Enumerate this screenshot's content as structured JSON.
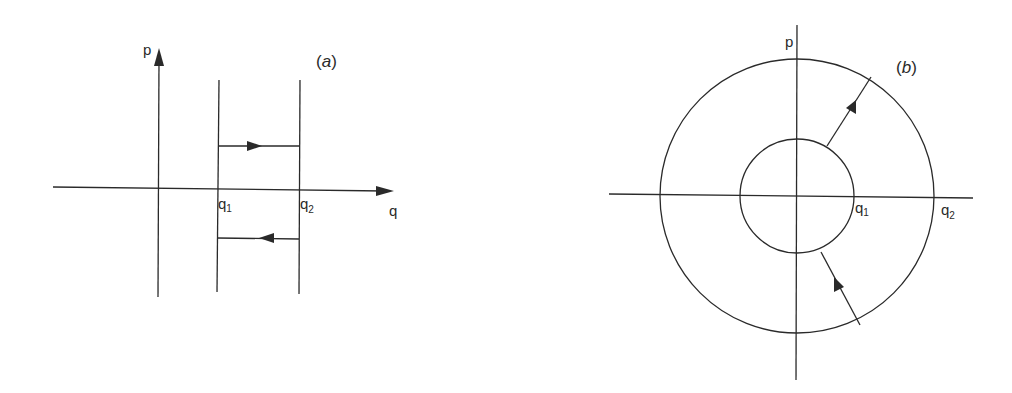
{
  "figure": {
    "panels": [
      {
        "id": "a",
        "label": "(a)",
        "label_letter": "a",
        "axes": {
          "vertical": "p",
          "horizontal": "q"
        },
        "markers": [
          {
            "base": "q",
            "sub": "1"
          },
          {
            "base": "q",
            "sub": "2"
          }
        ],
        "description": "Two vertical lines at q1 and q2; upper arrow moves right from q1 to q2, lower arrow moves left from q2 to q1"
      },
      {
        "id": "b",
        "label": "(b)",
        "label_letter": "b",
        "axes": {
          "vertical": "p",
          "horizontal": ""
        },
        "markers": [
          {
            "base": "q",
            "sub": "1"
          },
          {
            "base": "q",
            "sub": "2"
          }
        ],
        "description": "Concentric circles of radius q1 (inner) and q2 (outer); upper arrow points outward from inner to outer circle, lower arrow points inward from outer to inner circle"
      }
    ],
    "colors": {
      "ink": "#2a2a2a",
      "background": "#ffffff"
    }
  }
}
